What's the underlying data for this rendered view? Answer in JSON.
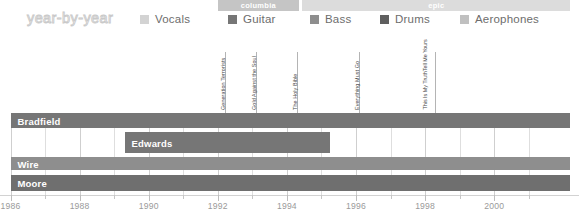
{
  "header": {
    "title": "year-by-year",
    "legend": [
      {
        "label": "Vocals",
        "color": "#d3d3d3",
        "x": 140
      },
      {
        "label": "Guitar",
        "color": "#767676",
        "x": 228
      },
      {
        "label": "Bass",
        "color": "#8e8e8e",
        "x": 310
      },
      {
        "label": "Drums",
        "color": "#5f5f5f",
        "x": 380
      },
      {
        "label": "Aerophones",
        "color": "#c0c0c0",
        "x": 460
      }
    ]
  },
  "label_band": [
    {
      "name": "columbia",
      "start": 1992.0,
      "end": 1994.35,
      "color": "#c5c5c5"
    },
    {
      "name": "epic",
      "start": 1994.45,
      "end": 2002.2,
      "color": "#dcdcdc"
    }
  ],
  "annotations": [
    {
      "title": "Generation Terrorists",
      "lines": [
        "Generation Terrorists"
      ],
      "year": 1992.2
    },
    {
      "title": "Gold Against the Soul",
      "lines": [
        "Gold Against the Soul"
      ],
      "year": 1993.1
    },
    {
      "title": "The Holy Bible",
      "lines": [
        "The Holy Bible"
      ],
      "year": 1994.3
    },
    {
      "title": "Everything Must Go",
      "lines": [
        "Everything Must Go"
      ],
      "year": 1996.1
    },
    {
      "title": "This Is My Truth Tell Me Yours",
      "lines": [
        "This Is My Truth",
        "Tell Me Yours"
      ],
      "year": 1998.3
    }
  ],
  "chart_data": {
    "type": "bar",
    "title": "year-by-year",
    "xlabel": "",
    "ylabel": "",
    "xlim": [
      1986,
      2001.6
    ],
    "grid": true,
    "legend_position": "top",
    "categories": [
      "Bradfield",
      "Edwards",
      "Wire",
      "Moore"
    ],
    "tick_labels": [
      "1986",
      "1988",
      "1990",
      "1992",
      "1994",
      "1996",
      "1998",
      "2000"
    ],
    "tick_values": [
      1986,
      1988,
      1990,
      1992,
      1994,
      1996,
      1998,
      2000
    ],
    "minor_ticks": [
      1987,
      1989,
      1991,
      1993,
      1995,
      1997,
      1999,
      2001
    ],
    "series": [
      {
        "name": "Bradfield",
        "color": "#767676",
        "row_top": 0,
        "row_height": 15,
        "label_inside": true,
        "spans": [
          {
            "start": 1986.0,
            "end": 2002.2
          }
        ]
      },
      {
        "name": "Edwards",
        "color": "#767676",
        "row_top": 19,
        "row_height": 21,
        "label_inside": true,
        "spans": [
          {
            "start": 1989.3,
            "end": 1995.25
          }
        ]
      },
      {
        "name": "Wire",
        "color": "#8e8e8e",
        "row_top": 44,
        "row_height": 13,
        "label_inside": true,
        "spans": [
          {
            "start": 1986.0,
            "end": 2002.2
          }
        ]
      },
      {
        "name": "Moore",
        "color": "#6f6f6f",
        "row_top": 62,
        "row_height": 16,
        "label_inside": true,
        "spans": [
          {
            "start": 1986.0,
            "end": 2002.2
          }
        ]
      }
    ]
  },
  "colors": {
    "background": "#ffffff",
    "grid": "#dedede",
    "axis": "#d2d2d2",
    "tick_text": "#9a9a9a",
    "legend_text": "#6d6d6d",
    "title_outline": "#c9c9c9",
    "annotation_text": "#4a4a4a",
    "annotation_rule": "#b4b4b4"
  }
}
